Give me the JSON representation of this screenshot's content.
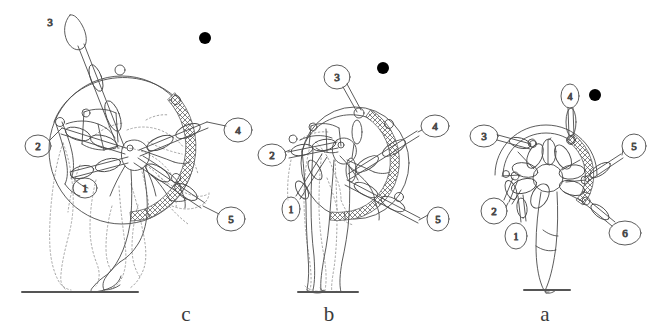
{
  "figure": {
    "type": "line-drawing",
    "background_color": "#ffffff",
    "stroke_color": "#4a4a4a",
    "ghost_stroke_color": "#9a9a9a",
    "ball_color": "#000000",
    "ground_color": "#555555",
    "caption_color": "#3b3b3b",
    "width": 658,
    "height": 331
  },
  "panels": [
    {
      "id": "panel-c",
      "caption": "c",
      "caption_x": 186,
      "caption_y": 321,
      "ground": {
        "x1": 22,
        "y1": 292,
        "x2": 138,
        "y2": 292
      },
      "ball": {
        "cx": 205,
        "cy": 38,
        "r": 6
      },
      "has_ghost_outline": true,
      "hoop": {
        "cx": 122,
        "cy": 150,
        "rx": 73,
        "ry": 74
      },
      "hatched_arc": {
        "start_deg": -62,
        "end_deg": 110
      },
      "segment_labels": [
        {
          "number": "3",
          "x": 50,
          "y": 19,
          "rx": 0,
          "ry": 0,
          "plain": true
        },
        {
          "number": "2",
          "x": 38,
          "y": 146,
          "rx": 13,
          "ry": 11,
          "plain": false
        },
        {
          "number": "1",
          "x": 85,
          "y": 188,
          "rx": 12,
          "ry": 10,
          "plain": false
        },
        {
          "number": "4",
          "x": 238,
          "y": 130,
          "rx": 14,
          "ry": 12,
          "plain": false
        },
        {
          "number": "5",
          "x": 231,
          "y": 219,
          "rx": 14,
          "ry": 12,
          "plain": false
        }
      ]
    },
    {
      "id": "panel-b",
      "caption": "b",
      "caption_x": 329,
      "caption_y": 321,
      "ground": {
        "x1": 298,
        "y1": 292,
        "x2": 358,
        "y2": 292
      },
      "ball": {
        "cx": 383,
        "cy": 68,
        "r": 6
      },
      "has_ghost_outline": true,
      "hoop": {
        "cx": 355,
        "cy": 163,
        "rx": 54,
        "ry": 56
      },
      "hatched_arc": {
        "start_deg": -72,
        "end_deg": 104
      },
      "segment_labels": [
        {
          "number": "3",
          "x": 337,
          "y": 77,
          "rx": 13,
          "ry": 12,
          "plain": false
        },
        {
          "number": "2",
          "x": 272,
          "y": 155,
          "rx": 14,
          "ry": 11,
          "plain": false
        },
        {
          "number": "1",
          "x": 291,
          "y": 209,
          "rx": 9,
          "ry": 12,
          "plain": false
        },
        {
          "number": "4",
          "x": 435,
          "y": 126,
          "rx": 14,
          "ry": 11,
          "plain": false
        },
        {
          "number": "5",
          "x": 438,
          "y": 219,
          "rx": 11,
          "ry": 12,
          "plain": false
        }
      ]
    },
    {
      "id": "panel-a",
      "caption": "a",
      "caption_x": 545,
      "caption_y": 321,
      "ground": {
        "x1": 524,
        "y1": 290,
        "x2": 570,
        "y2": 290
      },
      "ball": {
        "cx": 595,
        "cy": 95,
        "r": 6
      },
      "has_ghost_outline": false,
      "hoop": {
        "cx": 546,
        "cy": 175,
        "rx": 51,
        "ry": 50
      },
      "hatched_arc": {
        "start_deg": -74,
        "end_deg": 56
      },
      "segment_labels": [
        {
          "number": "4",
          "x": 570,
          "y": 96,
          "rx": 9,
          "ry": 12,
          "plain": false
        },
        {
          "number": "3",
          "x": 484,
          "y": 136,
          "rx": 14,
          "ry": 11,
          "plain": false
        },
        {
          "number": "5",
          "x": 634,
          "y": 146,
          "rx": 12,
          "ry": 12,
          "plain": false
        },
        {
          "number": "2",
          "x": 494,
          "y": 211,
          "rx": 13,
          "ry": 13,
          "plain": false
        },
        {
          "number": "1",
          "x": 516,
          "y": 236,
          "rx": 11,
          "ry": 13,
          "plain": false
        },
        {
          "number": "6",
          "x": 625,
          "y": 233,
          "rx": 16,
          "ry": 12,
          "plain": false
        }
      ]
    }
  ]
}
